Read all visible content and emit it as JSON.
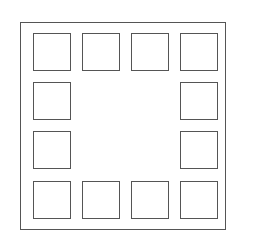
{
  "diagram": {
    "stroke_color": "#555555",
    "background": "#ffffff",
    "frame": {
      "x": 20,
      "y": 22,
      "w": 206,
      "h": 208
    },
    "squares": [
      {
        "x": 33,
        "y": 33
      },
      {
        "x": 82,
        "y": 33
      },
      {
        "x": 131,
        "y": 33
      },
      {
        "x": 180,
        "y": 33
      },
      {
        "x": 33,
        "y": 82
      },
      {
        "x": 180,
        "y": 82
      },
      {
        "x": 33,
        "y": 131
      },
      {
        "x": 180,
        "y": 131
      },
      {
        "x": 33,
        "y": 181
      },
      {
        "x": 82,
        "y": 181
      },
      {
        "x": 131,
        "y": 181
      },
      {
        "x": 180,
        "y": 181
      }
    ]
  }
}
